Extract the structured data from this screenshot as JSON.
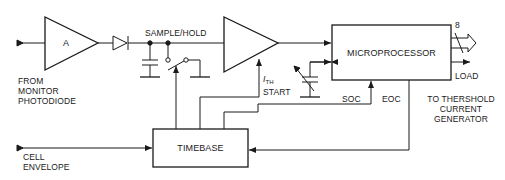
{
  "diagram": {
    "colors": {
      "stroke": "#1a1a1a",
      "background": "#ffffff"
    },
    "blocks": {
      "amplifier": {
        "label": "A"
      },
      "sample_hold": {
        "label": "SAMPLE/HOLD"
      },
      "microprocessor": {
        "label": "MICROPROCESSOR"
      },
      "timebase": {
        "label": "TIMEBASE"
      }
    },
    "inputs": {
      "monitor": {
        "line1": "FROM",
        "line2": "MONITOR",
        "line3": "PHOTODIODE"
      },
      "cell": {
        "line1": "CELL",
        "line2": "ENVELOPE"
      }
    },
    "signals": {
      "ith_symbol": "I",
      "ith_sub": "TH",
      "ith_start": "START",
      "soc": "SOC",
      "eoc": "EOC",
      "bus_width": "8",
      "load": "LOAD"
    },
    "outputs": {
      "threshold": {
        "line1": "TO THERSHOLD",
        "line2": "CURRENT",
        "line3": "GENERATOR"
      }
    }
  }
}
